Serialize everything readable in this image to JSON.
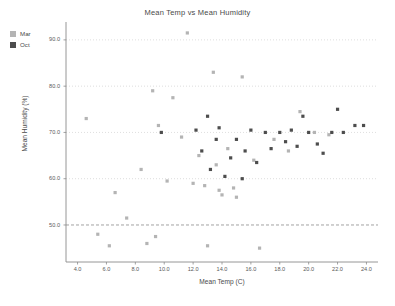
{
  "chart_data": {
    "type": "scatter",
    "title": "Mean Temp vs Mean Humidity",
    "xlabel": "Mean Temp (C)",
    "ylabel": "Mean Humidity (%)",
    "xlim": [
      3.2,
      24.8
    ],
    "ylim": [
      42.0,
      93.0
    ],
    "xticks": [
      "4.0",
      "6.0",
      "8.0",
      "10.0",
      "12.0",
      "14.0",
      "16.0",
      "18.0",
      "20.0",
      "22.0",
      "24.0"
    ],
    "xtick_values": [
      4.0,
      6.0,
      8.0,
      10.0,
      12.0,
      14.0,
      16.0,
      18.0,
      20.0,
      22.0,
      24.0
    ],
    "yticks": [
      "50.0",
      "60.0",
      "70.0",
      "80.0",
      "90.0"
    ],
    "ytick_values": [
      50.0,
      60.0,
      70.0,
      80.0,
      90.0
    ],
    "grid": true,
    "grid_style": "dotted-horizontal",
    "legend_position": "top-left-outside",
    "colors": {
      "mar": "#b4b4b4",
      "oct": "#4d4d4d",
      "axis": "#8a8a8a",
      "grid": "#c8c8c8",
      "text": "#4a4a4a",
      "background": "#ffffff"
    },
    "series": [
      {
        "name": "Mar",
        "color": "#b4b4b4",
        "points": [
          [
            4.6,
            73.0
          ],
          [
            5.4,
            48.0
          ],
          [
            6.2,
            45.5
          ],
          [
            6.6,
            57.0
          ],
          [
            7.4,
            51.5
          ],
          [
            8.4,
            62.0
          ],
          [
            8.8,
            46.0
          ],
          [
            9.2,
            79.0
          ],
          [
            9.4,
            47.5
          ],
          [
            9.6,
            71.5
          ],
          [
            10.2,
            59.5
          ],
          [
            10.6,
            77.5
          ],
          [
            11.2,
            69.0
          ],
          [
            11.6,
            91.5
          ],
          [
            12.0,
            59.0
          ],
          [
            12.4,
            65.0
          ],
          [
            12.8,
            58.5
          ],
          [
            13.0,
            45.5
          ],
          [
            13.4,
            83.0
          ],
          [
            13.6,
            63.0
          ],
          [
            13.8,
            57.5
          ],
          [
            14.0,
            56.5
          ],
          [
            14.4,
            66.5
          ],
          [
            14.8,
            58.0
          ],
          [
            15.0,
            56.0
          ],
          [
            15.4,
            82.0
          ],
          [
            16.2,
            64.0
          ],
          [
            16.6,
            45.0
          ],
          [
            17.6,
            68.5
          ],
          [
            18.6,
            66.0
          ],
          [
            19.4,
            74.5
          ],
          [
            20.4,
            70.0
          ],
          [
            21.4,
            69.5
          ]
        ]
      },
      {
        "name": "Oct",
        "color": "#4d4d4d",
        "points": [
          [
            9.8,
            70.0
          ],
          [
            12.2,
            70.5
          ],
          [
            12.6,
            66.0
          ],
          [
            13.0,
            73.5
          ],
          [
            13.2,
            62.0
          ],
          [
            13.6,
            68.5
          ],
          [
            13.8,
            71.0
          ],
          [
            14.2,
            60.5
          ],
          [
            14.6,
            64.5
          ],
          [
            15.0,
            68.5
          ],
          [
            15.4,
            60.0
          ],
          [
            15.6,
            66.0
          ],
          [
            16.0,
            70.5
          ],
          [
            16.4,
            63.5
          ],
          [
            17.0,
            70.0
          ],
          [
            17.4,
            66.5
          ],
          [
            18.0,
            70.0
          ],
          [
            18.4,
            68.0
          ],
          [
            18.8,
            70.5
          ],
          [
            19.2,
            67.0
          ],
          [
            19.6,
            73.5
          ],
          [
            20.0,
            70.0
          ],
          [
            20.6,
            67.5
          ],
          [
            21.0,
            65.5
          ],
          [
            21.6,
            70.0
          ],
          [
            22.0,
            75.0
          ],
          [
            22.4,
            70.0
          ],
          [
            23.2,
            71.5
          ],
          [
            23.8,
            71.5
          ]
        ]
      }
    ]
  },
  "legend": {
    "items": [
      {
        "label": "Mar",
        "color": "#b4b4b4"
      },
      {
        "label": "Oct",
        "color": "#4d4d4d"
      }
    ]
  }
}
